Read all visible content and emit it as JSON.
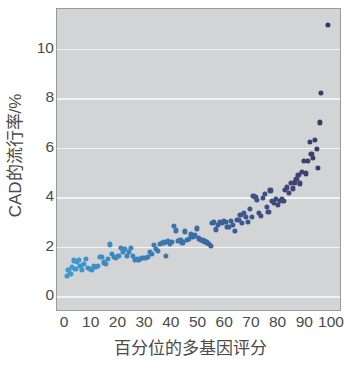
{
  "chart_data": {
    "type": "scatter",
    "title": "",
    "xlabel": "百分位的多基因评分",
    "ylabel": "CAD的流行率/%",
    "xlim": [
      -3,
      103
    ],
    "ylim": [
      -0.55,
      11.6
    ],
    "grid": true,
    "grid_axis": "y",
    "legend": "none",
    "xticks": [
      0,
      10,
      20,
      30,
      40,
      50,
      60,
      70,
      80,
      90,
      100
    ],
    "xtick_labels": [
      "0",
      "10",
      "20",
      "30",
      "40",
      "50",
      "60",
      "70",
      "80",
      "90",
      "100"
    ],
    "yticks": [
      0,
      2,
      4,
      6,
      8,
      10
    ],
    "ytick_labels": [
      "0",
      "2",
      "4",
      "6",
      "8",
      "10"
    ],
    "colormap": {
      "type": "sequential",
      "low": "#3d9bd0",
      "mid": "#3a6ba5",
      "high": "#3d3564",
      "mapped_to": "x"
    },
    "marker": {
      "shape": "circle",
      "size_px": 5.2
    },
    "background": "#d2d4d6",
    "gridline_color": "#f2f3f4",
    "axis_color": "#9a9a9c",
    "text_color": "#4a4a4a",
    "points": [
      [
        0.6,
        0.82
      ],
      [
        1.3,
        1.08
      ],
      [
        2.0,
        0.92
      ],
      [
        2.6,
        1.18
      ],
      [
        3.2,
        1.45
      ],
      [
        3.9,
        1.12
      ],
      [
        4.5,
        1.38
      ],
      [
        5.1,
        1.48
      ],
      [
        5.8,
        1.22
      ],
      [
        6.4,
        1.08
      ],
      [
        7.2,
        1.3
      ],
      [
        7.9,
        1.52
      ],
      [
        8.6,
        1.14
      ],
      [
        9.3,
        1.1
      ],
      [
        10.0,
        1.08
      ],
      [
        10.8,
        1.21
      ],
      [
        11.5,
        1.2
      ],
      [
        12.3,
        1.22
      ],
      [
        13.2,
        1.6
      ],
      [
        13.9,
        1.58
      ],
      [
        14.6,
        1.37
      ],
      [
        15.4,
        1.3
      ],
      [
        16.1,
        1.52
      ],
      [
        16.8,
        2.1
      ],
      [
        17.6,
        1.72
      ],
      [
        18.4,
        1.58
      ],
      [
        19.2,
        1.55
      ],
      [
        20.0,
        1.62
      ],
      [
        20.8,
        1.95
      ],
      [
        21.6,
        1.78
      ],
      [
        22.4,
        1.92
      ],
      [
        23.1,
        1.62
      ],
      [
        23.9,
        1.8
      ],
      [
        24.6,
        1.97
      ],
      [
        25.3,
        1.62
      ],
      [
        26.1,
        1.48
      ],
      [
        26.8,
        1.52
      ],
      [
        27.5,
        1.48
      ],
      [
        28.2,
        1.52
      ],
      [
        28.9,
        1.55
      ],
      [
        29.6,
        1.56
      ],
      [
        30.3,
        1.56
      ],
      [
        31.0,
        1.58
      ],
      [
        31.8,
        1.8
      ],
      [
        32.5,
        1.72
      ],
      [
        33.3,
        2.08
      ],
      [
        34.0,
        1.9
      ],
      [
        34.8,
        1.82
      ],
      [
        35.5,
        2.12
      ],
      [
        36.2,
        2.15
      ],
      [
        37.0,
        2.18
      ],
      [
        37.7,
        1.62
      ],
      [
        38.5,
        2.22
      ],
      [
        39.3,
        2.12
      ],
      [
        40.0,
        2.2
      ],
      [
        40.8,
        2.86
      ],
      [
        41.6,
        2.66
      ],
      [
        42.4,
        2.24
      ],
      [
        43.2,
        2.26
      ],
      [
        44.0,
        2.18
      ],
      [
        44.8,
        2.62
      ],
      [
        45.6,
        2.28
      ],
      [
        46.4,
        2.32
      ],
      [
        47.2,
        2.5
      ],
      [
        48.0,
        2.4
      ],
      [
        48.8,
        2.46
      ],
      [
        49.5,
        2.74
      ],
      [
        50.3,
        2.34
      ],
      [
        51.0,
        2.28
      ],
      [
        51.8,
        2.26
      ],
      [
        52.5,
        2.22
      ],
      [
        53.2,
        2.18
      ],
      [
        53.9,
        2.12
      ],
      [
        54.5,
        2.04
      ],
      [
        55.2,
        2.95
      ],
      [
        55.9,
        3.02
      ],
      [
        56.6,
        2.7
      ],
      [
        57.3,
        2.88
      ],
      [
        58.0,
        3.0
      ],
      [
        58.7,
        2.98
      ],
      [
        59.4,
        3.05
      ],
      [
        60.1,
        3.02
      ],
      [
        60.8,
        2.8
      ],
      [
        61.5,
        2.82
      ],
      [
        62.2,
        3.04
      ],
      [
        62.9,
        2.9
      ],
      [
        63.6,
        2.64
      ],
      [
        64.3,
        3.1
      ],
      [
        65.0,
        3.08
      ],
      [
        65.7,
        3.28
      ],
      [
        66.4,
        2.96
      ],
      [
        67.1,
        3.38
      ],
      [
        67.8,
        3.22
      ],
      [
        68.5,
        3.0
      ],
      [
        69.2,
        3.52
      ],
      [
        69.9,
        3.2
      ],
      [
        70.6,
        4.06
      ],
      [
        71.3,
        4.02
      ],
      [
        72.0,
        3.88
      ],
      [
        72.7,
        3.36
      ],
      [
        73.4,
        3.24
      ],
      [
        74.1,
        3.98
      ],
      [
        74.8,
        4.12
      ],
      [
        75.5,
        3.6
      ],
      [
        76.2,
        3.42
      ],
      [
        76.9,
        4.28
      ],
      [
        77.6,
        3.86
      ],
      [
        78.3,
        3.78
      ],
      [
        79.0,
        3.92
      ],
      [
        79.7,
        3.7
      ],
      [
        80.4,
        3.84
      ],
      [
        81.1,
        3.92
      ],
      [
        81.8,
        3.86
      ],
      [
        82.5,
        4.3
      ],
      [
        83.2,
        4.4
      ],
      [
        83.9,
        4.18
      ],
      [
        84.6,
        4.58
      ],
      [
        85.3,
        4.36
      ],
      [
        86.0,
        4.6
      ],
      [
        86.7,
        4.74
      ],
      [
        87.4,
        4.9
      ],
      [
        88.1,
        4.56
      ],
      [
        88.8,
        5.02
      ],
      [
        89.5,
        5.46
      ],
      [
        90.2,
        4.96
      ],
      [
        90.9,
        5.48
      ],
      [
        91.6,
        6.22
      ],
      [
        92.3,
        5.76
      ],
      [
        93.0,
        5.58
      ],
      [
        93.6,
        6.32
      ],
      [
        94.2,
        5.94
      ],
      [
        94.8,
        5.18
      ],
      [
        95.4,
        7.02
      ],
      [
        96.0,
        8.22
      ],
      [
        98.5,
        10.95
      ]
    ]
  }
}
